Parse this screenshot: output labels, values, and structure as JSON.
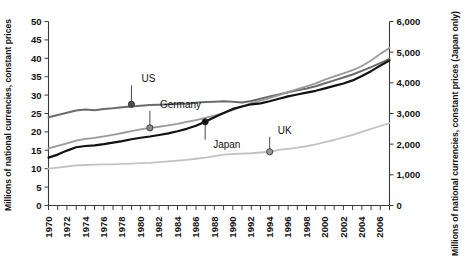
{
  "chart_data": {
    "type": "line",
    "title": "",
    "subtitle": "",
    "xlabel": "",
    "ylabel": "Millions of national currencies, constant prices",
    "y2label": "Millions of national currencies, constant prices (Japan only)",
    "xlim": [
      1970,
      2007
    ],
    "ylim": [
      0,
      50
    ],
    "y2lim": [
      0,
      6000
    ],
    "grid": false,
    "legend_position": "inline-callouts",
    "xticks": [
      1970,
      1972,
      1974,
      1976,
      1978,
      1980,
      1982,
      1984,
      1986,
      1988,
      1990,
      1992,
      1994,
      1996,
      1998,
      2000,
      2002,
      2004,
      2006
    ],
    "xtick_labels": [
      "1970",
      "1972",
      "1974",
      "1976",
      "1978",
      "1980",
      "1982",
      "1984",
      "1986",
      "1988",
      "1990",
      "1992",
      "1994",
      "1996",
      "1998",
      "2000",
      "2002",
      "2004",
      "2006"
    ],
    "xminor_every": 1,
    "yticks": [
      0,
      5,
      10,
      15,
      20,
      25,
      30,
      35,
      40,
      45,
      50
    ],
    "ytick_labels": [
      "0",
      "5",
      "10",
      "15",
      "20",
      "25",
      "30",
      "35",
      "40",
      "45",
      "50"
    ],
    "y2ticks": [
      0,
      1000,
      2000,
      3000,
      4000,
      5000,
      6000
    ],
    "y2tick_labels": [
      "0",
      "1,000",
      "2,000",
      "3,000",
      "4,000",
      "5,000",
      "6,000"
    ],
    "x": [
      1970,
      1971,
      1972,
      1973,
      1974,
      1975,
      1976,
      1977,
      1978,
      1979,
      1980,
      1981,
      1982,
      1983,
      1984,
      1985,
      1986,
      1987,
      1988,
      1989,
      1990,
      1991,
      1992,
      1993,
      1994,
      1995,
      1996,
      1997,
      1998,
      1999,
      2000,
      2001,
      2002,
      2003,
      2004,
      2005,
      2006,
      2007
    ],
    "series": [
      {
        "name": "US",
        "axis": "left",
        "color": "#6b6b6b",
        "width": 2.0,
        "values": [
          24.0,
          24.6,
          25.2,
          25.8,
          26.1,
          25.9,
          26.2,
          26.4,
          26.7,
          26.9,
          27.1,
          27.3,
          27.4,
          27.5,
          27.6,
          27.7,
          27.9,
          28.1,
          28.2,
          28.3,
          28.2,
          28.0,
          28.4,
          29.0,
          29.6,
          30.2,
          30.8,
          31.3,
          31.8,
          32.4,
          33.2,
          34.0,
          34.8,
          35.6,
          36.6,
          37.6,
          38.7,
          39.8
        ]
      },
      {
        "name": "Germany",
        "axis": "left",
        "color": "#9a9a9a",
        "width": 1.8,
        "values": [
          15.5,
          16.2,
          16.9,
          17.6,
          18.1,
          18.4,
          18.8,
          19.2,
          19.7,
          20.2,
          20.7,
          21.1,
          21.4,
          21.8,
          22.2,
          22.7,
          23.2,
          23.8,
          24.4,
          25.1,
          25.9,
          26.9,
          27.8,
          28.5,
          29.2,
          30.0,
          30.8,
          31.6,
          32.4,
          33.2,
          34.2,
          35.1,
          35.9,
          36.8,
          37.9,
          39.4,
          41.2,
          42.8
        ]
      },
      {
        "name": "Japan",
        "axis": "right",
        "color": "#111111",
        "width": 2.2,
        "values": [
          1560,
          1660,
          1790,
          1900,
          1940,
          1960,
          2000,
          2050,
          2100,
          2160,
          2210,
          2250,
          2300,
          2350,
          2420,
          2500,
          2600,
          2730,
          2880,
          3020,
          3150,
          3230,
          3300,
          3330,
          3400,
          3480,
          3560,
          3620,
          3680,
          3740,
          3820,
          3900,
          3980,
          4080,
          4220,
          4380,
          4560,
          4730
        ]
      },
      {
        "name": "UK",
        "axis": "left",
        "color": "#c2c2c2",
        "width": 1.8,
        "values": [
          10.0,
          10.3,
          10.6,
          10.9,
          11.0,
          11.1,
          11.2,
          11.2,
          11.3,
          11.4,
          11.5,
          11.6,
          11.8,
          12.0,
          12.2,
          12.4,
          12.7,
          13.0,
          13.4,
          13.8,
          14.0,
          14.1,
          14.2,
          14.4,
          14.6,
          15.1,
          15.4,
          15.7,
          16.1,
          16.6,
          17.2,
          17.8,
          18.5,
          19.2,
          20.0,
          20.8,
          21.6,
          22.4
        ]
      }
    ],
    "callouts": [
      {
        "label": "US",
        "series": "US",
        "x": 1979,
        "y": 27.5,
        "dot_color": "#4d4d4d",
        "label_dx": 10,
        "label_dy": -22
      },
      {
        "label": "Germany",
        "series": "Germany",
        "x": 1981,
        "y": 21.1,
        "dot_color": "#8a8a8a",
        "label_dx": 10,
        "label_dy": -20
      },
      {
        "label": "Japan",
        "series": "Japan",
        "x": 1987,
        "y": 2730,
        "dot_color": "#111111",
        "label_dx": 8,
        "label_dy": 26
      },
      {
        "label": "UK",
        "series": "UK",
        "x": 1994,
        "y": 14.6,
        "dot_color": "#9a9a9a",
        "label_dx": 8,
        "label_dy": -18
      }
    ]
  }
}
